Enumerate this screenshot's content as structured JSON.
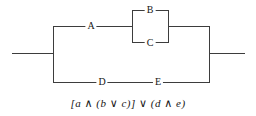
{
  "diagram": {
    "type": "switching-circuit",
    "switches": {
      "a": "A",
      "b": "B",
      "c": "C",
      "d": "D",
      "e": "E"
    },
    "formula": "[a ∧ (b ∨ c)] ∨ (d ∧ e)",
    "colors": {
      "wire": "#3d3d3d",
      "text": "#161616",
      "background": "#ffffff"
    }
  }
}
